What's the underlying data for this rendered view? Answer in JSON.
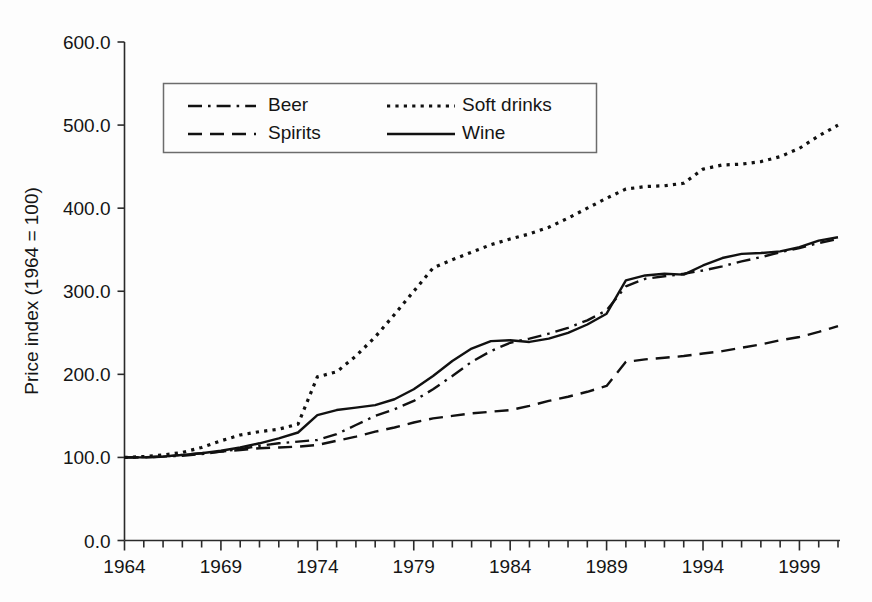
{
  "chart_data": {
    "type": "line",
    "title": "",
    "subtitle": "",
    "xlabel": "",
    "ylabel": "Price index (1964 = 100)",
    "xlim": [
      1964,
      2001
    ],
    "ylim": [
      0,
      600
    ],
    "yticks": [
      "0.0",
      "100.0",
      "200.0",
      "300.0",
      "400.0",
      "500.0",
      "600.0"
    ],
    "ytick_values": [
      0,
      100,
      200,
      300,
      400,
      500,
      600
    ],
    "xticks": [
      "1964",
      "1969",
      "1974",
      "1979",
      "1984",
      "1989",
      "1994",
      "1999"
    ],
    "xtick_values": [
      1964,
      1969,
      1974,
      1979,
      1984,
      1989,
      1994,
      1999
    ],
    "minor_xtick_interval": 1,
    "grid": false,
    "legend_position": "upper-left-inside",
    "x": [
      1964,
      1965,
      1966,
      1967,
      1968,
      1969,
      1970,
      1971,
      1972,
      1973,
      1974,
      1975,
      1976,
      1977,
      1978,
      1979,
      1980,
      1981,
      1982,
      1983,
      1984,
      1985,
      1986,
      1987,
      1988,
      1989,
      1990,
      1991,
      1992,
      1993,
      1994,
      1995,
      1996,
      1997,
      1998,
      1999,
      2000,
      2001
    ],
    "series": [
      {
        "name": "Beer",
        "style": "dash-dot",
        "values": [
          100,
          100,
          101,
          102,
          104,
          107,
          110,
          114,
          117,
          119,
          121,
          128,
          139,
          150,
          158,
          168,
          182,
          198,
          215,
          228,
          238,
          243,
          249,
          256,
          265,
          277,
          306,
          315,
          318,
          321,
          325,
          330,
          336,
          341,
          347,
          352,
          358,
          363
        ]
      },
      {
        "name": "Soft drinks",
        "style": "dotted",
        "values": [
          100,
          101,
          103,
          106,
          112,
          120,
          127,
          131,
          134,
          140,
          197,
          203,
          222,
          245,
          272,
          300,
          328,
          338,
          347,
          356,
          363,
          369,
          377,
          388,
          400,
          412,
          423,
          426,
          427,
          430,
          447,
          452,
          453,
          456,
          462,
          472,
          487,
          500
        ]
      },
      {
        "name": "Spirits",
        "style": "dashed",
        "values": [
          100,
          100,
          101,
          103,
          105,
          107,
          109,
          111,
          112,
          113,
          115,
          120,
          125,
          131,
          136,
          142,
          147,
          150,
          153,
          155,
          157,
          162,
          168,
          173,
          179,
          186,
          215,
          218,
          220,
          222,
          225,
          228,
          232,
          236,
          241,
          245,
          251,
          258
        ]
      },
      {
        "name": "Wine",
        "style": "solid",
        "values": [
          100,
          100,
          101,
          103,
          105,
          108,
          112,
          117,
          123,
          130,
          151,
          157,
          160,
          163,
          170,
          182,
          198,
          216,
          231,
          240,
          241,
          239,
          243,
          250,
          260,
          273,
          313,
          319,
          321,
          320,
          331,
          340,
          345,
          346,
          348,
          353,
          361,
          365
        ]
      }
    ]
  },
  "legend": {
    "entries": [
      {
        "label": "Beer",
        "style": "dash-dot"
      },
      {
        "label": "Soft drinks",
        "style": "dotted"
      },
      {
        "label": "Spirits",
        "style": "dashed"
      },
      {
        "label": "Wine",
        "style": "solid"
      }
    ]
  },
  "colors": {
    "line": "#111111",
    "axis": "#2a2a2a",
    "text": "#151515",
    "background": "#fdfdfd",
    "legend_border": "#6c6c6c"
  }
}
